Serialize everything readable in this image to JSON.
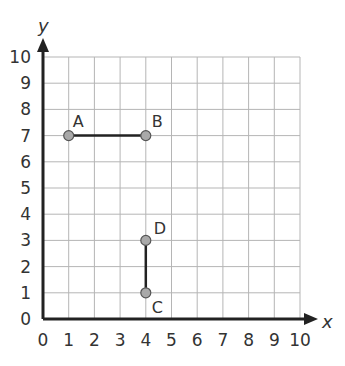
{
  "diagram": {
    "axes": {
      "x_label": "x",
      "y_label": "y",
      "x_min": 0,
      "x_max": 10,
      "y_min": 0,
      "y_max": 10,
      "x_ticks": [
        "0",
        "1",
        "2",
        "3",
        "4",
        "5",
        "6",
        "7",
        "8",
        "9",
        "10"
      ],
      "y_ticks": [
        "0",
        "1",
        "2",
        "3",
        "4",
        "5",
        "6",
        "7",
        "8",
        "9",
        "10"
      ]
    },
    "points": [
      {
        "label": "A",
        "x": 1,
        "y": 7
      },
      {
        "label": "B",
        "x": 4,
        "y": 7
      },
      {
        "label": "C",
        "x": 4,
        "y": 1
      },
      {
        "label": "D",
        "x": 4,
        "y": 3
      }
    ],
    "segments": [
      {
        "from": "A",
        "to": "B"
      },
      {
        "from": "C",
        "to": "D"
      }
    ],
    "colors": {
      "grid": "#b5b5b5",
      "axis": "#222222",
      "segment": "#222222",
      "point_fill": "#a9a9a9",
      "point_stroke": "#555555"
    }
  }
}
